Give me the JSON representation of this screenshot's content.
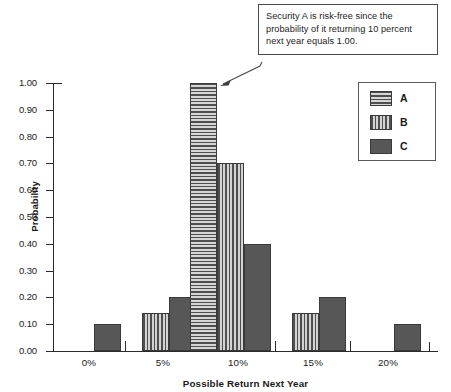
{
  "callout": {
    "name": "chart-callout",
    "text": "Security A is risk-free since the probability of it returning 10 percent next year equals 1.00.",
    "arrow_icon": "arrow-pointer-icon"
  },
  "legend": {
    "title": "",
    "position": "top-right",
    "entries": [
      {
        "label": "A",
        "pattern": "horizontal-stripes",
        "swatch_icon": "legend-swatch-a-icon"
      },
      {
        "label": "B",
        "pattern": "vertical-stripes",
        "swatch_icon": "legend-swatch-b-icon"
      },
      {
        "label": "C",
        "pattern": "solid-dark-gray",
        "swatch_icon": "legend-swatch-c-icon"
      }
    ]
  },
  "axes": {
    "y_title": "Probability",
    "x_title": "Possible Return Next Year",
    "y_ticks": [
      "1.00",
      "0.90",
      "0.80",
      "0.70",
      "0.60",
      "0.50",
      "0.40",
      "0.30",
      "0.20",
      "0.10",
      "0.00"
    ],
    "x_ticks": [
      "0%",
      "5%",
      "10%",
      "15%",
      "20%"
    ]
  },
  "colors": {
    "series_c": "#575757",
    "pattern_dark": "#4f4f4f",
    "pattern_light": "#d6d6d6",
    "axis": "#2b2b2b",
    "background": "#ffffff"
  },
  "chart_data": {
    "type": "bar",
    "title": "",
    "subtitle": "",
    "xlabel": "Possible Return Next Year",
    "ylabel": "Probability",
    "categories": [
      "0%",
      "5%",
      "10%",
      "15%",
      "20%"
    ],
    "ylim": [
      0.0,
      1.0
    ],
    "ytick_step": 0.1,
    "grid": false,
    "legend_position": "top-right",
    "series": [
      {
        "name": "A",
        "pattern": "horizontal-stripes",
        "values": [
          0.0,
          0.0,
          1.0,
          0.0,
          0.0
        ]
      },
      {
        "name": "B",
        "pattern": "vertical-stripes",
        "values": [
          0.0,
          0.14,
          0.7,
          0.14,
          0.0
        ]
      },
      {
        "name": "C",
        "pattern": "solid",
        "values": [
          0.1,
          0.2,
          0.4,
          0.2,
          0.1
        ]
      }
    ],
    "annotations": [
      {
        "text": "Security A is risk-free since the probability of it returning 10 percent next year equals 1.00.",
        "points_to": {
          "series": "A",
          "category": "10%",
          "value": 1.0
        }
      }
    ]
  }
}
